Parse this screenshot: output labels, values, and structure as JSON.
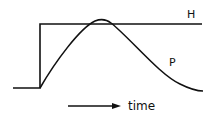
{
  "diagram": {
    "curves": [
      {
        "id": "H",
        "label": "H",
        "description": "step input"
      },
      {
        "id": "P",
        "label": "P",
        "description": "response curve"
      }
    ],
    "axis_label": "time",
    "stroke_color": "#111111",
    "background": "#ffffff"
  }
}
